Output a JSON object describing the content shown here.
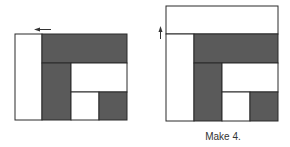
{
  "caption": "Make 4.",
  "colors": {
    "dark": "#5a5a5a",
    "light": "#ffffff",
    "stroke": "#2a2a2a",
    "arrow": "#333333"
  },
  "figures": [
    {
      "name": "before",
      "arrow": {
        "direction": "left"
      },
      "regions": [
        {
          "fill": "light",
          "x": 15,
          "y": 34,
          "w": 27,
          "h": 86
        },
        {
          "fill": "dark",
          "x": 42,
          "y": 34,
          "w": 85,
          "h": 29
        },
        {
          "fill": "dark",
          "x": 42,
          "y": 63,
          "w": 29,
          "h": 57
        },
        {
          "fill": "light",
          "x": 71,
          "y": 63,
          "w": 56,
          "h": 29
        },
        {
          "fill": "light",
          "x": 71,
          "y": 92,
          "w": 28,
          "h": 28
        },
        {
          "fill": "dark",
          "x": 99,
          "y": 92,
          "w": 28,
          "h": 28
        }
      ]
    },
    {
      "name": "after",
      "arrow": {
        "direction": "up"
      },
      "regions": [
        {
          "fill": "light",
          "x": 166,
          "y": 6,
          "w": 112,
          "h": 28
        },
        {
          "fill": "light",
          "x": 166,
          "y": 34,
          "w": 28,
          "h": 87
        },
        {
          "fill": "dark",
          "x": 194,
          "y": 34,
          "w": 84,
          "h": 29
        },
        {
          "fill": "dark",
          "x": 194,
          "y": 63,
          "w": 28,
          "h": 58
        },
        {
          "fill": "light",
          "x": 222,
          "y": 63,
          "w": 56,
          "h": 29
        },
        {
          "fill": "light",
          "x": 222,
          "y": 92,
          "w": 28,
          "h": 29
        },
        {
          "fill": "dark",
          "x": 250,
          "y": 92,
          "w": 28,
          "h": 29
        }
      ]
    }
  ]
}
